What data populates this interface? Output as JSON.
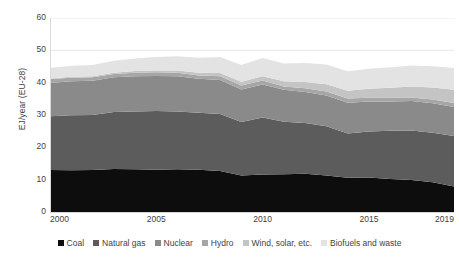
{
  "chart_data": {
    "type": "area",
    "stacked": true,
    "title": "",
    "subtitle": "",
    "xlabel": "",
    "ylabel": "EJ/year (EU-28)",
    "xlim": [
      2000,
      2019
    ],
    "ylim": [
      0,
      60
    ],
    "grid": true,
    "grid_axis": "y",
    "legend_position": "bottom",
    "x": [
      2000,
      2001,
      2002,
      2003,
      2004,
      2005,
      2006,
      2007,
      2008,
      2009,
      2010,
      2011,
      2012,
      2013,
      2014,
      2015,
      2016,
      2017,
      2018,
      2019
    ],
    "x_tick_labels": [
      "2000",
      "2005",
      "2010",
      "2015",
      "2019"
    ],
    "x_ticks": [
      2000,
      2005,
      2010,
      2015,
      2019
    ],
    "y_tick_labels": [
      "0",
      "10",
      "20",
      "30",
      "40",
      "50",
      "60"
    ],
    "y_ticks": [
      0,
      10,
      20,
      30,
      40,
      50,
      60
    ],
    "series": [
      {
        "name": "Coal",
        "color": "#0d0d0d",
        "values": [
          13.0,
          12.9,
          13.0,
          13.3,
          13.2,
          13.1,
          13.2,
          13.1,
          12.7,
          11.3,
          11.6,
          11.7,
          11.8,
          11.3,
          10.6,
          10.7,
          10.2,
          9.9,
          9.2,
          7.9
        ]
      },
      {
        "name": "Natural gas",
        "color": "#5c5c5c",
        "values": [
          16.6,
          17.0,
          17.0,
          17.6,
          17.9,
          18.1,
          17.9,
          17.6,
          17.6,
          16.5,
          17.6,
          16.2,
          15.7,
          15.2,
          13.7,
          14.2,
          14.9,
          15.3,
          15.3,
          15.6
        ]
      },
      {
        "name": "Nuclear",
        "color": "#8a8a8a",
        "values": [
          10.3,
          10.5,
          10.6,
          10.8,
          10.9,
          10.9,
          10.9,
          10.5,
          10.5,
          10.1,
          10.2,
          9.9,
          9.6,
          9.5,
          9.5,
          9.3,
          9.1,
          9.1,
          9.1,
          9.0
        ]
      },
      {
        "name": "Hydro",
        "color": "#a6a6a6",
        "values": [
          1.2,
          1.1,
          1.1,
          1.0,
          1.1,
          1.1,
          1.1,
          1.0,
          1.2,
          1.2,
          1.3,
          1.0,
          1.2,
          1.3,
          1.3,
          1.1,
          1.2,
          1.1,
          1.2,
          1.2
        ]
      },
      {
        "name": "Wind, solar, etc.",
        "color": "#c4c4c4",
        "values": [
          0.2,
          0.3,
          0.3,
          0.4,
          0.5,
          0.6,
          0.7,
          0.9,
          1.0,
          1.2,
          1.3,
          1.6,
          1.9,
          2.2,
          2.4,
          2.8,
          3.0,
          3.4,
          3.7,
          4.1
        ]
      },
      {
        "name": "Biofuels and waste",
        "color": "#e3e3e3",
        "values": [
          3.2,
          3.4,
          3.5,
          3.7,
          3.9,
          4.1,
          4.4,
          4.6,
          4.9,
          5.2,
          5.6,
          5.5,
          5.9,
          6.1,
          6.0,
          6.2,
          6.4,
          6.5,
          6.6,
          6.7
        ]
      }
    ],
    "totals": [
      44.5,
      45.2,
      45.5,
      46.8,
      47.5,
      47.9,
      48.2,
      47.7,
      47.9,
      45.5,
      47.6,
      45.9,
      46.1,
      45.6,
      43.5,
      44.3,
      44.8,
      45.3,
      45.1,
      44.5
    ]
  },
  "axes": {
    "y_title": "EJ/year (EU-28)",
    "y_labels": [
      "60",
      "50",
      "40",
      "30",
      "20",
      "10",
      "0"
    ],
    "x_labels": [
      "2000",
      "2005",
      "2010",
      "2015",
      "2019"
    ]
  },
  "legend": {
    "items": [
      {
        "label": "Coal",
        "color": "#0d0d0d"
      },
      {
        "label": "Natural gas",
        "color": "#5c5c5c"
      },
      {
        "label": "Nuclear",
        "color": "#8a8a8a"
      },
      {
        "label": "Hydro",
        "color": "#a6a6a6"
      },
      {
        "label": "Wind, solar, etc.",
        "color": "#c4c4c4"
      },
      {
        "label": "Biofuels and waste",
        "color": "#e3e3e3"
      }
    ]
  },
  "style": {
    "background": "#ffffff",
    "grid_color": "#e8e8e8",
    "axis_color": "#d9d9d9",
    "text_color": "#3f3f3f"
  }
}
